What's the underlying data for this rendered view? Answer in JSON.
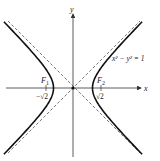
{
  "figure": {
    "equation": "x² − y² = 1",
    "axes": {
      "x_label": "x",
      "y_label": "y"
    },
    "foci": [
      {
        "name": "F₁",
        "letter": "F",
        "sub": "1",
        "tick_label": "−√2",
        "x": -1.4142
      },
      {
        "name": "F₂",
        "letter": "F",
        "sub": "2",
        "tick_label": "√2",
        "x": 1.4142
      }
    ],
    "asymptotes": [
      "y = x",
      "y = −x"
    ],
    "colors": {
      "curve": "#111111",
      "axis": "#333333",
      "asymptote": "#444444"
    }
  },
  "chart_data": {
    "type": "line",
    "title": "x² − y² = 1",
    "xlabel": "x",
    "ylabel": "y",
    "xlim": [
      -3.4,
      3.4
    ],
    "ylim": [
      -3.5,
      3.5
    ],
    "grid": false,
    "series": [
      {
        "name": "hyperbola right branch",
        "equation": "x = cosh(t), y = sinh(t)",
        "style": "solid"
      },
      {
        "name": "hyperbola left branch",
        "equation": "x = -cosh(t), y = sinh(t)",
        "style": "solid"
      },
      {
        "name": "asymptote y = x",
        "style": "dashed"
      },
      {
        "name": "asymptote y = -x",
        "style": "dashed"
      }
    ],
    "annotations": [
      {
        "text": "F₁",
        "x": -1.4142,
        "y": 0
      },
      {
        "text": "F₂",
        "x": 1.4142,
        "y": 0
      },
      {
        "text": "−√2",
        "x": -1.4142,
        "y": 0
      },
      {
        "text": "√2",
        "x": 1.4142,
        "y": 0
      },
      {
        "text": "x² − y² = 1",
        "x": 2.0,
        "y": 1.55
      }
    ]
  }
}
